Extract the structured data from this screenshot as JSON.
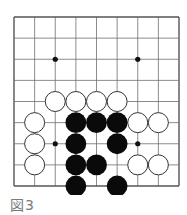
{
  "caption": "図3",
  "board": {
    "cols": 9,
    "rows": 9,
    "origin": [
      14,
      17
    ],
    "end": [
      179,
      186
    ],
    "line_color": "#6e6e6e",
    "border_color": "#555555",
    "stone_radius": 10,
    "star_points": [
      [
        2,
        2
      ],
      [
        6,
        2
      ],
      [
        2,
        6
      ],
      [
        6,
        6
      ]
    ],
    "white_stones": [
      [
        2,
        4
      ],
      [
        3,
        4
      ],
      [
        4,
        4
      ],
      [
        5,
        4
      ],
      [
        1,
        5
      ],
      [
        6,
        5
      ],
      [
        7,
        5
      ],
      [
        1,
        6
      ],
      [
        1,
        7
      ],
      [
        6,
        7
      ],
      [
        7,
        7
      ]
    ],
    "black_stones": [
      [
        3,
        5
      ],
      [
        4,
        5
      ],
      [
        5,
        5
      ],
      [
        3,
        6
      ],
      [
        5,
        6
      ],
      [
        3,
        7
      ],
      [
        4,
        7
      ],
      [
        3,
        8
      ],
      [
        5,
        8
      ]
    ]
  }
}
